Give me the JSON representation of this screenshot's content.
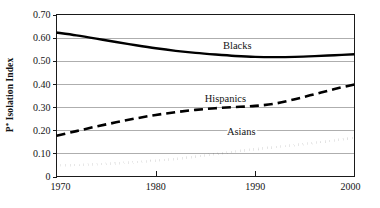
{
  "chart_data": {
    "type": "line",
    "title": "",
    "xlabel": "",
    "ylabel": "P* Isolation Index",
    "ylabel_plain": "P* Isolation Index",
    "xlim": [
      1970,
      2000
    ],
    "ylim": [
      0,
      0.7
    ],
    "grid": true,
    "legend_position": "inline-labels",
    "x_ticks": [
      1970,
      1980,
      1990,
      2000
    ],
    "x_tick_labels": [
      "1970",
      "1980",
      "1990",
      "2000"
    ],
    "y_ticks": [
      0,
      0.1,
      0.2,
      0.3,
      0.4,
      0.5,
      0.6,
      0.7
    ],
    "y_tick_labels": [
      "0",
      "0.10",
      "0.20",
      "0.30",
      "0.40",
      "0.50",
      "0.60",
      "0.70"
    ],
    "x": [
      1970,
      1972,
      1974,
      1976,
      1978,
      1980,
      1982,
      1984,
      1986,
      1988,
      1990,
      1992,
      1994,
      1996,
      1998,
      2000
    ],
    "series": [
      {
        "name": "Blacks",
        "style": "solid",
        "color": "#000000",
        "line_width": 2.4,
        "label_x": 1988.2,
        "label_y": 0.565,
        "values": [
          0.622,
          0.61,
          0.596,
          0.581,
          0.567,
          0.554,
          0.543,
          0.534,
          0.527,
          0.521,
          0.517,
          0.516,
          0.517,
          0.52,
          0.524,
          0.528
        ]
      },
      {
        "name": "Hispanics",
        "style": "dashed",
        "color": "#000000",
        "line_width": 2.6,
        "label_x": 1987.0,
        "label_y": 0.338,
        "values": [
          0.176,
          0.196,
          0.216,
          0.234,
          0.251,
          0.266,
          0.278,
          0.288,
          0.295,
          0.3,
          0.305,
          0.315,
          0.334,
          0.356,
          0.378,
          0.398
        ]
      },
      {
        "name": "Asians",
        "style": "dotted",
        "color": "#000000",
        "line_width": 2.6,
        "label_x": 1988.6,
        "label_y": 0.196,
        "values": [
          0.048,
          0.05,
          0.053,
          0.057,
          0.062,
          0.068,
          0.076,
          0.086,
          0.097,
          0.108,
          0.118,
          0.127,
          0.136,
          0.146,
          0.156,
          0.168
        ]
      }
    ]
  }
}
